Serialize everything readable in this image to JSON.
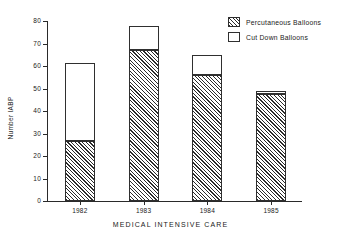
{
  "chart_data": {
    "type": "bar",
    "title": "",
    "subtitle": "",
    "xlabel": "MEDICAL INTENSIVE CARE",
    "ylabel": "Number IABP",
    "categories": [
      "1982",
      "1983",
      "1984",
      "1985"
    ],
    "ylim": [
      0,
      80
    ],
    "yticks": [
      0,
      10,
      20,
      30,
      40,
      50,
      60,
      70,
      80
    ],
    "ytick_labels": [
      "0",
      "10",
      "20",
      "30",
      "40",
      "50",
      "60",
      "70",
      "80"
    ],
    "grid": false,
    "stacked": true,
    "legend_position": "top-right",
    "series": [
      {
        "name": "Percutaneous Balloons",
        "pattern": "diagonal-hatch",
        "values": [
          26.5,
          67,
          56,
          47.5
        ]
      },
      {
        "name": "Cut Down Balloons",
        "pattern": "empty",
        "values": [
          35,
          11,
          9,
          1.5
        ]
      }
    ],
    "totals": [
      61.5,
      78,
      65,
      49
    ]
  },
  "legend": {
    "items": [
      {
        "label": "Percutaneous Balloons",
        "swatch": "hatched-swatch"
      },
      {
        "label": "Cut Down Balloons",
        "swatch": "empty-swatch"
      }
    ]
  },
  "colors": {
    "axis": "#2a2a2a",
    "hatch": "#2b2b2b",
    "background": "#ffffff",
    "bar_outline": "#2f2f2f"
  }
}
